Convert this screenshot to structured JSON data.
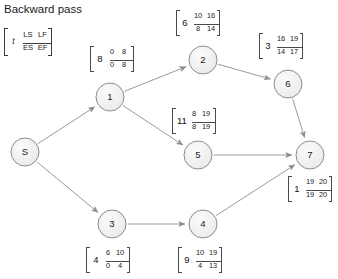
{
  "title": "Backward pass",
  "legend": {
    "top_left": "LS",
    "top_right": "LF",
    "bottom_left": "ES",
    "bottom_right": "EF",
    "duration": "t"
  },
  "colors": {
    "node_fill": "#f0f0f0",
    "node_stroke": "#8d8d8d",
    "edge": "#9a9a9a",
    "text": "#1b1b1b",
    "box_stroke": "#4a4a4a",
    "background": "#ffffff"
  },
  "chart_data": {
    "type": "diagram",
    "title": "Backward pass",
    "diagram_kind": "activity-on-node-network-cpm",
    "nodes": [
      {
        "id": "S",
        "label": "S",
        "cx": 25,
        "cy": 152,
        "r": 14,
        "has_box": false,
        "ls": null,
        "lf": null,
        "es": null,
        "ef": null,
        "duration": null,
        "box_x": null,
        "box_y": null
      },
      {
        "id": "1",
        "label": "1",
        "cx": 110,
        "cy": 97,
        "r": 14,
        "has_box": true,
        "ls": "0",
        "lf": "8",
        "es": "0",
        "ef": "8",
        "duration": "8",
        "box_x": 90,
        "box_y": 46
      },
      {
        "id": "2",
        "label": "2",
        "cx": 203,
        "cy": 60,
        "r": 14,
        "has_box": true,
        "ls": "10",
        "lf": "16",
        "es": "8",
        "ef": "14",
        "duration": "6",
        "box_x": 176,
        "box_y": 10
      },
      {
        "id": "3",
        "label": "3",
        "cx": 112,
        "cy": 224,
        "r": 14,
        "has_box": true,
        "ls": "6",
        "lf": "10",
        "es": "0",
        "ef": "4",
        "duration": "4",
        "box_x": 86,
        "box_y": 247
      },
      {
        "id": "4",
        "label": "4",
        "cx": 203,
        "cy": 224,
        "r": 14,
        "has_box": true,
        "ls": "10",
        "lf": "19",
        "es": "4",
        "ef": "13",
        "duration": "9",
        "box_x": 178,
        "box_y": 247
      },
      {
        "id": "5",
        "label": "5",
        "cx": 198,
        "cy": 155,
        "r": 14,
        "has_box": true,
        "ls": "8",
        "lf": "19",
        "es": "8",
        "ef": "19",
        "duration": "11",
        "box_x": 172,
        "box_y": 108
      },
      {
        "id": "6",
        "label": "6",
        "cx": 288,
        "cy": 84,
        "r": 14,
        "has_box": true,
        "ls": "16",
        "lf": "19",
        "es": "14",
        "ef": "17",
        "duration": "3",
        "box_x": 259,
        "box_y": 33
      },
      {
        "id": "7",
        "label": "7",
        "cx": 310,
        "cy": 155,
        "r": 14,
        "has_box": true,
        "ls": "19",
        "lf": "20",
        "es": "19",
        "ef": "20",
        "duration": "1",
        "box_x": 288,
        "box_y": 176
      }
    ],
    "edges": [
      {
        "from": "S",
        "to": "1"
      },
      {
        "from": "S",
        "to": "3"
      },
      {
        "from": "1",
        "to": "2"
      },
      {
        "from": "1",
        "to": "5"
      },
      {
        "from": "2",
        "to": "6"
      },
      {
        "from": "3",
        "to": "4"
      },
      {
        "from": "4",
        "to": "7"
      },
      {
        "from": "5",
        "to": "7"
      },
      {
        "from": "6",
        "to": "7"
      }
    ]
  }
}
